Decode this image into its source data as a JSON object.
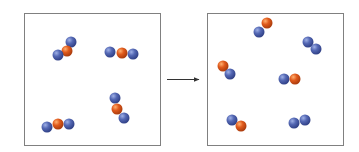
{
  "diagram": {
    "colors": {
      "blue_atom": "#4a5fa8",
      "blue_atom_highlight": "#8fa0d8",
      "orange_atom": "#d9541c",
      "orange_atom_highlight": "#f59a55",
      "box_border": "#808080",
      "arrow": "#333333"
    },
    "atom_radius": 5.5,
    "left_box": {
      "x": 24,
      "y": 13,
      "w": 136,
      "h": 132,
      "label": "reactants",
      "molecules": [
        {
          "name": "molecule-1",
          "atoms": [
            {
              "c": "blue",
              "x": 71,
              "y": 42
            },
            {
              "c": "orange",
              "x": 67,
              "y": 51
            },
            {
              "c": "blue",
              "x": 58,
              "y": 55
            }
          ]
        },
        {
          "name": "molecule-2",
          "atoms": [
            {
              "c": "blue",
              "x": 110,
              "y": 52
            },
            {
              "c": "blue",
              "x": 133,
              "y": 54
            },
            {
              "c": "orange",
              "x": 122,
              "y": 53
            }
          ]
        },
        {
          "name": "molecule-3",
          "atoms": [
            {
              "c": "blue",
              "x": 115,
              "y": 98
            },
            {
              "c": "blue",
              "x": 124,
              "y": 118
            },
            {
              "c": "orange",
              "x": 117,
              "y": 109
            }
          ]
        },
        {
          "name": "molecule-4",
          "atoms": [
            {
              "c": "blue",
              "x": 47,
              "y": 127
            },
            {
              "c": "blue",
              "x": 69,
              "y": 124
            },
            {
              "c": "orange",
              "x": 58,
              "y": 124
            }
          ]
        }
      ]
    },
    "arrow": {
      "x1": 167,
      "y1": 79,
      "x2": 199,
      "y2": 79
    },
    "right_box": {
      "x": 207,
      "y": 13,
      "w": 136,
      "h": 132,
      "label": "products",
      "molecules": [
        {
          "name": "molecule-co-1",
          "atoms": [
            {
              "c": "orange",
              "x": 267,
              "y": 23
            },
            {
              "c": "blue",
              "x": 259,
              "y": 32
            }
          ]
        },
        {
          "name": "molecule-o2-1",
          "atoms": [
            {
              "c": "blue",
              "x": 308,
              "y": 42
            },
            {
              "c": "blue",
              "x": 316,
              "y": 49
            }
          ]
        },
        {
          "name": "molecule-co-2",
          "atoms": [
            {
              "c": "orange",
              "x": 223,
              "y": 66
            },
            {
              "c": "blue",
              "x": 230,
              "y": 74
            }
          ]
        },
        {
          "name": "molecule-co-3",
          "atoms": [
            {
              "c": "blue",
              "x": 284,
              "y": 79
            },
            {
              "c": "orange",
              "x": 295,
              "y": 79
            }
          ]
        },
        {
          "name": "molecule-co-4",
          "atoms": [
            {
              "c": "blue",
              "x": 232,
              "y": 120
            },
            {
              "c": "orange",
              "x": 241,
              "y": 126
            }
          ]
        },
        {
          "name": "molecule-o2-2",
          "atoms": [
            {
              "c": "blue",
              "x": 294,
              "y": 123
            },
            {
              "c": "blue",
              "x": 305,
              "y": 120
            }
          ]
        }
      ]
    }
  }
}
